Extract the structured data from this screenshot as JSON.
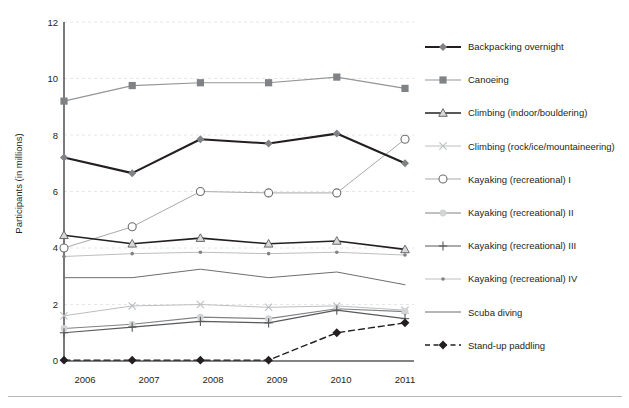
{
  "chart_data": {
    "type": "line",
    "title": "",
    "xlabel": "",
    "ylabel": "Participants (in millions)",
    "categories": [
      "2006",
      "2007",
      "2008",
      "2009",
      "2010",
      "2011"
    ],
    "x": [
      2006,
      2007,
      2008,
      2009,
      2010,
      2011
    ],
    "ylim": [
      0,
      12
    ],
    "yticks": [
      0,
      2,
      4,
      6,
      8,
      10,
      12
    ],
    "grid": "horizontal dashed light gray",
    "legend_position": "right",
    "series": [
      {
        "name": "Backpacking overnight",
        "values": [
          7.2,
          6.65,
          7.85,
          7.7,
          8.05,
          7.0
        ],
        "color": "#231f20",
        "marker": "diamond",
        "marker_color": "#808285",
        "line_style": "solid",
        "line_width": 2.1
      },
      {
        "name": "Canoeing",
        "values": [
          9.2,
          9.75,
          9.85,
          9.85,
          10.05,
          9.65
        ],
        "color": "#939598",
        "marker": "square",
        "marker_color": "#808285",
        "line_style": "solid",
        "line_width": 1.2
      },
      {
        "name": "Climbing (indoor/bouldering)",
        "values": [
          4.45,
          4.15,
          4.35,
          4.15,
          4.25,
          3.95
        ],
        "color": "#231f20",
        "marker": "triangle",
        "marker_color": "#d9d9d9",
        "line_style": "solid",
        "line_width": 1.6
      },
      {
        "name": "Climbing (rock/ice/mountaineering)",
        "values": [
          1.6,
          1.95,
          2.0,
          1.9,
          1.95,
          1.8
        ],
        "color": "#bcbec0",
        "marker": "x",
        "marker_color": "#bcbec0",
        "line_style": "solid",
        "line_width": 1.0
      },
      {
        "name": "Kayaking (recreational) I",
        "values": [
          4.0,
          4.75,
          6.0,
          5.95,
          5.95,
          7.85
        ],
        "color": "#a7a9ac",
        "marker": "circle-open",
        "marker_color": "#6d6e71",
        "line_style": "solid",
        "line_width": 1.0
      },
      {
        "name": "Kayaking (recreational) II",
        "values": [
          1.15,
          1.3,
          1.55,
          1.5,
          1.85,
          1.75
        ],
        "color": "#808285",
        "marker": "circle-filled",
        "marker_color": "#d1d3d4",
        "line_style": "solid",
        "line_width": 1.2
      },
      {
        "name": "Kayaking (recreational) III",
        "values": [
          1.0,
          1.2,
          1.4,
          1.35,
          1.8,
          1.5
        ],
        "color": "#58595b",
        "marker": "plus",
        "marker_color": "#58595b",
        "line_style": "solid",
        "line_width": 1.2
      },
      {
        "name": "Kayaking (recreational) IV",
        "values": [
          3.7,
          3.8,
          3.85,
          3.8,
          3.85,
          3.75
        ],
        "color": "#bcbec0",
        "marker": "dot",
        "marker_color": "#808285",
        "line_style": "solid",
        "line_width": 1.0
      },
      {
        "name": "Scuba diving",
        "values": [
          2.95,
          2.95,
          3.25,
          2.95,
          3.15,
          2.7
        ],
        "color": "#6d6e71",
        "marker": "none",
        "marker_color": "#6d6e71",
        "line_style": "solid",
        "line_width": 1.0
      },
      {
        "name": "Stand-up paddling",
        "values": [
          0.03,
          0.03,
          0.03,
          0.03,
          1.0,
          1.35
        ],
        "color": "#231f20",
        "marker": "diamond-filled",
        "marker_color": "#231f20",
        "line_style": "dashed",
        "line_width": 1.4
      }
    ]
  },
  "axis": {
    "y_title": "Participants (in millions)",
    "y_ticks": [
      "12",
      "10",
      "8",
      "6",
      "4",
      "2",
      "0"
    ],
    "x_ticks": [
      "2006",
      "2007",
      "2008",
      "2009",
      "2010",
      "2011"
    ]
  },
  "legend": {
    "items": [
      {
        "label": "Backpacking overnight"
      },
      {
        "label": "Canoeing"
      },
      {
        "label": "Climbing (indoor/bouldering)"
      },
      {
        "label": "Climbing (rock/ice/mountaineering)"
      },
      {
        "label": "Kayaking (recreational) I"
      },
      {
        "label": "Kayaking (recreational) II"
      },
      {
        "label": "Kayaking (recreational) III"
      },
      {
        "label": "Kayaking (recreational) IV"
      },
      {
        "label": "Scuba diving"
      },
      {
        "label": "Stand-up paddling"
      }
    ]
  },
  "colors": {
    "axis": "#58595b",
    "grid": "#e6e6e6",
    "text": "#231f20",
    "rule": "#b9b9b9"
  }
}
